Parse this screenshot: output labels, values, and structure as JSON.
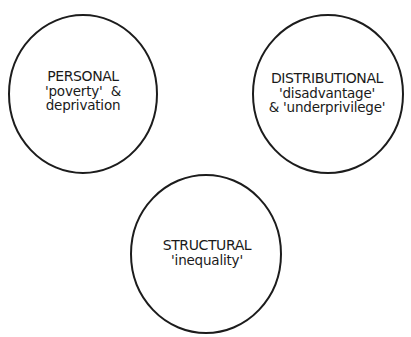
{
  "diagram": {
    "stroke_color": "#1c1c1c",
    "background": "#ffffff",
    "nodes": [
      {
        "id": "personal",
        "title": "PERSONAL",
        "lines": [
          "'poverty'  &",
          "deprivation"
        ],
        "shape": "circle",
        "center": [
          83,
          94
        ],
        "radius": [
          74,
          79
        ]
      },
      {
        "id": "distributional",
        "title": "DISTRIBUTIONAL",
        "lines": [
          "'disadvantage'",
          "& 'underprivilege'"
        ],
        "shape": "circle",
        "center": [
          328,
          94
        ],
        "radius": [
          75,
          79
        ]
      },
      {
        "id": "structural",
        "title": "STRUCTURAL",
        "lines": [
          "'inequality'"
        ],
        "shape": "circle",
        "center": [
          206,
          254
        ],
        "radius": [
          75,
          79
        ]
      }
    ]
  }
}
